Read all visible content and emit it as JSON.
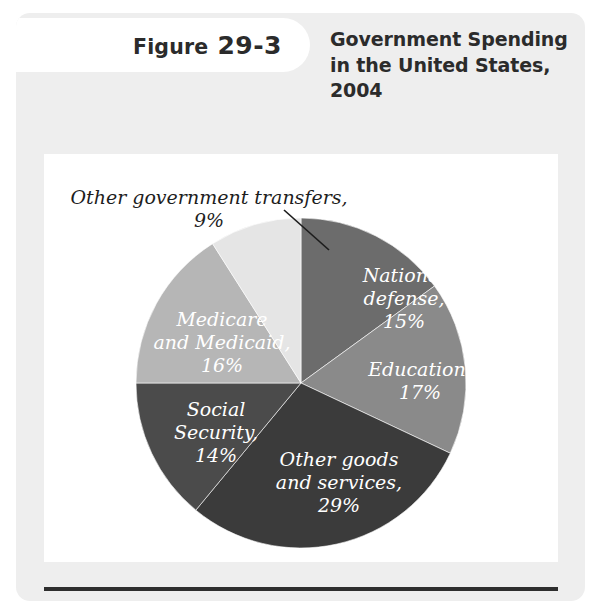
{
  "figure": {
    "badge_word": "Figure",
    "badge_number": "29-3",
    "title": "Government Spending in the United States, 2004"
  },
  "chart_data": {
    "type": "pie",
    "title": "Government Spending in the United States, 2004",
    "units": "percent of total government spending",
    "start_angle_deg": 0,
    "direction": "clockwise",
    "legend": "none (labels on slices)",
    "grid": false,
    "categories": [
      "National defense",
      "Education",
      "Other goods and services",
      "Social Security",
      "Medicare and Medicaid",
      "Other government transfers"
    ],
    "values": [
      15,
      17,
      29,
      14,
      16,
      9
    ],
    "colors": [
      "#6c6c6c",
      "#8a8a8a",
      "#3b3b3b",
      "#4b4b4b",
      "#b6b6b6",
      "#e5e5e5"
    ],
    "slices": [
      {
        "label": "National defense",
        "percent": "15%",
        "value": 15,
        "color": "#6c6c6c",
        "label_lines": [
          "National",
          "defense,",
          "15%"
        ],
        "label_placement": "inside",
        "label_x": 360,
        "label_y": 128,
        "text_anchor": "middle",
        "text_color": "#ffffff"
      },
      {
        "label": "Education",
        "percent": "17%",
        "value": 17,
        "color": "#8a8a8a",
        "label_lines": [
          "Education,",
          "17%"
        ],
        "label_placement": "inside",
        "label_x": 376,
        "label_y": 222,
        "text_anchor": "middle",
        "text_color": "#ffffff"
      },
      {
        "label": "Other goods and services",
        "percent": "29%",
        "value": 29,
        "color": "#3b3b3b",
        "label_lines": [
          "Other goods",
          "and services,",
          "29%"
        ],
        "label_placement": "inside",
        "label_x": 295,
        "label_y": 312,
        "text_anchor": "middle",
        "text_color": "#ffffff"
      },
      {
        "label": "Social Security",
        "percent": "14%",
        "value": 14,
        "color": "#4b4b4b",
        "label_lines": [
          "Social",
          "Security,",
          "14%"
        ],
        "label_placement": "inside",
        "label_x": 172,
        "label_y": 262,
        "text_anchor": "middle",
        "text_color": "#ffffff"
      },
      {
        "label": "Medicare and Medicaid",
        "percent": "16%",
        "value": 16,
        "color": "#b6b6b6",
        "label_lines": [
          "Medicare",
          "and Medicaid,",
          "16%"
        ],
        "label_placement": "inside",
        "label_x": 178,
        "label_y": 172,
        "text_anchor": "middle",
        "text_color": "#ffffff"
      },
      {
        "label": "Other government transfers",
        "percent": "9%",
        "value": 9,
        "color": "#e5e5e5",
        "label_lines": [
          "Other government transfers,",
          "9%"
        ],
        "label_placement": "outside-callout",
        "label_x": 165,
        "label_y": 50,
        "text_anchor": "middle",
        "text_color": "#1d1d1d",
        "leader_from_x": 240,
        "leader_from_y": 56,
        "leader_to_x": 285,
        "leader_to_y": 96
      }
    ]
  }
}
